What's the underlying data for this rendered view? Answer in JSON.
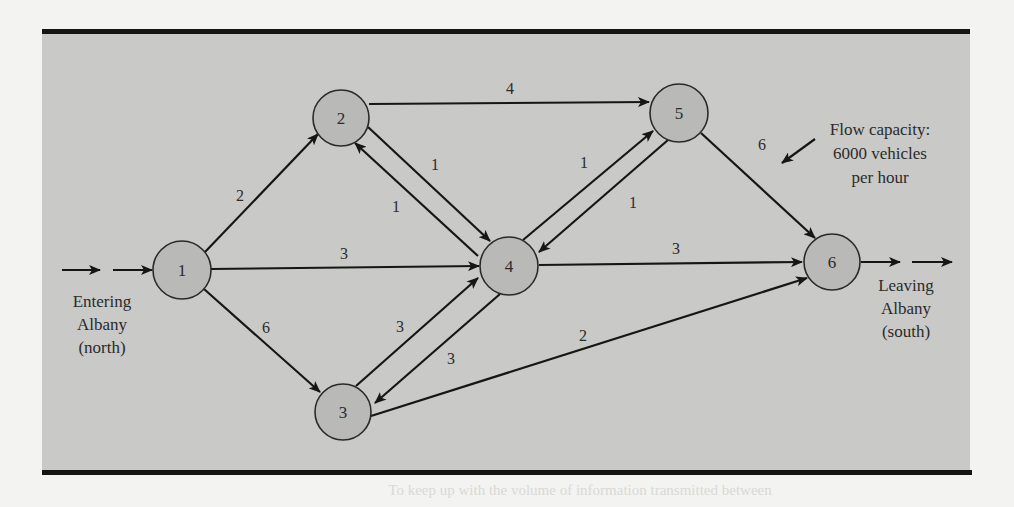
{
  "diagram": {
    "type": "network-flow",
    "nodes": [
      {
        "id": "1",
        "label": "1",
        "cx": 182,
        "cy": 270,
        "r": 29
      },
      {
        "id": "2",
        "label": "2",
        "cx": 341,
        "cy": 118,
        "r": 28
      },
      {
        "id": "3",
        "label": "3",
        "cx": 343,
        "cy": 412,
        "r": 28
      },
      {
        "id": "4",
        "label": "4",
        "cx": 509,
        "cy": 266,
        "r": 29
      },
      {
        "id": "5",
        "label": "5",
        "cx": 679,
        "cy": 113,
        "r": 29
      },
      {
        "id": "6",
        "label": "6",
        "cx": 832,
        "cy": 262,
        "r": 28
      }
    ],
    "edges": [
      {
        "from": "1",
        "to": "2",
        "capacity": "2"
      },
      {
        "from": "1",
        "to": "4",
        "capacity": "3"
      },
      {
        "from": "1",
        "to": "3",
        "capacity": "6"
      },
      {
        "from": "2",
        "to": "5",
        "capacity": "4"
      },
      {
        "from": "2",
        "to": "4",
        "capacity": "1"
      },
      {
        "from": "4",
        "to": "2",
        "capacity": "1"
      },
      {
        "from": "4",
        "to": "5",
        "capacity": "1"
      },
      {
        "from": "5",
        "to": "4",
        "capacity": "1"
      },
      {
        "from": "3",
        "to": "4",
        "capacity": "3"
      },
      {
        "from": "4",
        "to": "3",
        "capacity": "3"
      },
      {
        "from": "4",
        "to": "6",
        "capacity": "3"
      },
      {
        "from": "3",
        "to": "6",
        "capacity": "2"
      },
      {
        "from": "5",
        "to": "6",
        "capacity": "6"
      }
    ],
    "entry_label": [
      "Entering",
      "Albany",
      "(north)"
    ],
    "exit_label": [
      "Leaving",
      "Albany",
      "(south)"
    ],
    "annotation": [
      "Flow capacity:",
      "6000 vehicles",
      "per hour"
    ]
  },
  "edge_labels": {
    "e12": "2",
    "e14": "3",
    "e13": "6",
    "e25": "4",
    "e24": "1",
    "e42": "1",
    "e45": "1",
    "e54": "1",
    "e34": "3",
    "e43": "3",
    "e46": "3",
    "e36": "2",
    "e56": "6"
  },
  "node_labels": {
    "n1": "1",
    "n2": "2",
    "n3": "3",
    "n4": "4",
    "n5": "5",
    "n6": "6"
  },
  "text": {
    "entry_1": "Entering",
    "entry_2": "Albany",
    "entry_3": "(north)",
    "exit_1": "Leaving",
    "exit_2": "Albany",
    "exit_3": "(south)",
    "annot_1": "Flow capacity:",
    "annot_2": "6000 vehicles",
    "annot_3": "per hour",
    "bleed_through": "To keep up with the volume of information transmitted between"
  },
  "colors": {
    "panel": "#c9c9c7",
    "node_fill": "#b9b9b7",
    "line": "#161616",
    "page": "#f3f3f1"
  }
}
